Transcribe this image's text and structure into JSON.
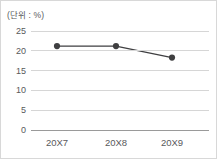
{
  "chart_data": {
    "type": "line",
    "title": "",
    "subtitle": "",
    "unit_label": "(단위 : %)",
    "xlabel": "",
    "ylabel": "",
    "categories": [
      "20X7",
      "20X8",
      "20X9"
    ],
    "values": [
      21.2,
      21.2,
      18.3
    ],
    "series": [
      {
        "name": "",
        "values": [
          21.2,
          21.2,
          18.3
        ]
      }
    ],
    "ylim": [
      0,
      25
    ],
    "yticks": [
      0,
      5,
      10,
      15,
      20,
      25
    ],
    "ytick_labels": [
      "0",
      "5",
      "10",
      "15",
      "20",
      "25"
    ],
    "grid": true,
    "grid_axis": "y",
    "legend": false,
    "legend_position": "none",
    "markers": "circle",
    "annotations": []
  },
  "colors": {
    "background": "#ffffff",
    "border": "#d8d8d8",
    "gridline": "#d6d6d6",
    "axis": "#9a9a9a",
    "text": "#58595b",
    "series_line": "#3f3f41",
    "series_marker": "#3f3f41"
  }
}
